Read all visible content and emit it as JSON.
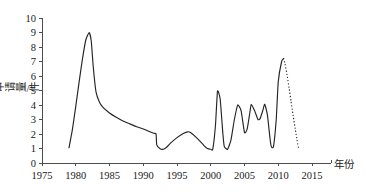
{
  "chart_data": {
    "type": "line",
    "title": "",
    "xlabel": "年份",
    "ylabel": "申请量/件",
    "xlim": [
      1975,
      2015
    ],
    "ylim": [
      0,
      10
    ],
    "xticks": [
      1975,
      1980,
      1985,
      1990,
      1995,
      2000,
      2005,
      2010,
      2015
    ],
    "yticks": [
      0,
      1,
      2,
      3,
      4,
      5,
      6,
      7,
      8,
      9,
      10
    ],
    "grid": false,
    "legend": null,
    "series": [
      {
        "name": "申请量",
        "style": "solid",
        "x": [
          1979.0,
          1979.5,
          1980.0,
          1980.5,
          1981.0,
          1981.5,
          1982.0,
          1982.3,
          1982.6,
          1983.0,
          1983.5,
          1984.0,
          1985.0,
          1986.0,
          1987.0,
          1988.0,
          1989.0,
          1990.0,
          1991.0,
          1991.6,
          1991.9,
          1992.0,
          1992.5,
          1993.0,
          1993.5,
          1994.0,
          1995.0,
          1996.0,
          1996.6,
          1997.0,
          1998.0,
          1999.0,
          1999.5,
          2000.0,
          2000.3,
          2000.7,
          2001.0,
          2001.4,
          2001.8,
          2002.0,
          2002.5,
          2003.0,
          2003.5,
          2004.0,
          2004.5,
          2005.0,
          2005.4,
          2005.8,
          2006.0,
          2006.5,
          2007.0,
          2007.3,
          2007.7,
          2008.0,
          2008.4,
          2008.8,
          2009.0,
          2009.3,
          2009.7,
          2010.0,
          2010.5,
          2010.8
        ],
        "y": [
          1.05,
          2.3,
          3.9,
          5.6,
          7.2,
          8.5,
          9.0,
          8.4,
          6.6,
          4.9,
          4.2,
          3.85,
          3.45,
          3.15,
          2.9,
          2.7,
          2.5,
          2.35,
          2.15,
          2.05,
          2.0,
          1.25,
          0.98,
          0.95,
          1.1,
          1.35,
          1.75,
          2.05,
          2.15,
          2.1,
          1.7,
          1.2,
          1.0,
          0.95,
          0.95,
          2.6,
          4.95,
          4.4,
          2.0,
          1.15,
          0.95,
          1.6,
          3.0,
          4.0,
          3.6,
          2.1,
          2.35,
          3.5,
          4.05,
          3.6,
          3.0,
          3.05,
          3.6,
          4.05,
          3.3,
          1.6,
          1.1,
          1.15,
          3.0,
          5.6,
          7.0,
          7.2
        ]
      },
      {
        "name": "预测",
        "style": "dotted",
        "x": [
          2010.8,
          2011.0,
          2011.3,
          2011.6,
          2011.9,
          2012.2,
          2012.5,
          2012.8,
          2013.0
        ],
        "y": [
          7.2,
          6.85,
          6.1,
          5.2,
          4.25,
          3.3,
          2.4,
          1.55,
          1.05
        ]
      }
    ]
  },
  "axes": {
    "x_axis_label": "年份",
    "y_axis_label": "申请量/件",
    "x_tick_labels": [
      "1975",
      "1980",
      "1985",
      "1990",
      "1995",
      "2000",
      "2005",
      "2010",
      "2015"
    ],
    "y_tick_labels": [
      "0",
      "1",
      "2",
      "3",
      "4",
      "5",
      "6",
      "7",
      "8",
      "9",
      "10"
    ]
  },
  "colors": {
    "line": "#242424",
    "axis": "#4d4d4d",
    "text": "#1a1a1a",
    "background": "#ffffff"
  }
}
